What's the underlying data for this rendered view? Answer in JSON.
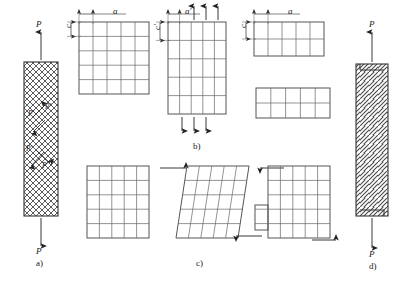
{
  "figure": {
    "panels": {
      "a": "a)",
      "b": "b)",
      "c": "c)",
      "d": "d)"
    },
    "caption": "",
    "colors": {
      "line": "#333333",
      "grid": "#555555",
      "hatch": "#444444",
      "background": "#ffffff"
    }
  },
  "panel_a": {
    "name": "tensile-specimen-cross-hatched",
    "load_top": "P",
    "load_bottom": "P",
    "internal_force_1": "P′",
    "internal_force_2": "P′",
    "internal_force_3": "P′",
    "internal_force_4": "P′",
    "hatch_style": "cross-hatch"
  },
  "panel_b": {
    "name": "tension-grid-deformation",
    "grid_undeformed": {
      "label": "undeformed-grid",
      "cols": 5,
      "rows": 5,
      "dim_horizontal": "a",
      "dim_vertical": "c"
    },
    "grid_tension": {
      "label": "axially-stretched-grid",
      "cols": 5,
      "rows": 5,
      "dim_horizontal": "a′",
      "dim_vertical": "c′",
      "arrows_top": 3,
      "arrows_bottom": 3,
      "arrow_direction_top": "up",
      "arrow_direction_bottom": "down"
    },
    "grid_wide_undeformed": {
      "label": "wide-undeformed-grid",
      "cols": 5,
      "rows": 2,
      "dim_horizontal": "a",
      "dim_vertical": "c"
    },
    "grid_wide_deformed": {
      "label": "wide-deformed-grid",
      "cols": 5,
      "rows": 2
    }
  },
  "panel_c": {
    "name": "shear-grid-deformation",
    "grid_undeformed": {
      "label": "undeformed-grid",
      "cols": 5,
      "rows": 5
    },
    "grid_sheared": {
      "label": "sheared-grid",
      "cols": 5,
      "rows": 5,
      "arrow_top_direction": "right",
      "arrow_bottom_direction": "left"
    },
    "grid_offset": {
      "label": "offset-block-grid",
      "cols": 5,
      "rows": 5,
      "arrow_top_direction": "right",
      "arrow_bottom_direction": "left"
    }
  },
  "panel_d": {
    "name": "shear-specimen-diagonal-hatched",
    "load_top": "P",
    "load_bottom": "P",
    "hatch_style": "diagonal-hatch"
  }
}
